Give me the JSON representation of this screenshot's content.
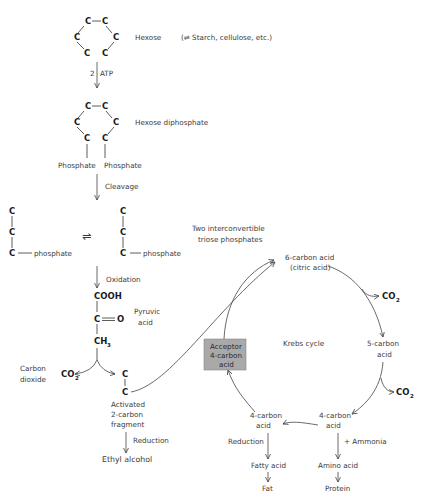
{
  "diagram": {
    "hexose": {
      "atom": "C",
      "label": "Hexose",
      "note": "(⇌ Starch, cellulose, etc.)"
    },
    "step_atp": {
      "coef": "2",
      "label": "ATP"
    },
    "hexose_diphosphate": {
      "label": "Hexose diphosphate",
      "phosphate_left": "Phosphate",
      "phosphate_right": "Phosphate"
    },
    "cleavage": {
      "label": "Cleavage"
    },
    "triose": {
      "left_phosphate": "phosphate",
      "right_phosphate": "phosphate",
      "equilibrium": "⇌",
      "label_line1": "Two interconvertible",
      "label_line2": "triose phosphates"
    },
    "oxidation": {
      "label": "Oxidation"
    },
    "pyruvic": {
      "cooh": "COOH",
      "c": "C",
      "o": "O",
      "ch": "CH",
      "ch_sub": "3",
      "label_line1": "Pyruvic",
      "label_line2": "acid"
    },
    "decarboxylation": {
      "co2": "CO",
      "co2_sub": "2",
      "label_line1": "Carbon",
      "label_line2": "dioxide"
    },
    "fragment": {
      "c": "C",
      "label_line1": "Activated",
      "label_line2": "2-carbon",
      "label_line3": "fragment"
    },
    "reduction_left": {
      "label": "Reduction",
      "product": "Ethyl alcohol"
    },
    "krebs": {
      "center_label": "Krebs cycle",
      "six_carbon_line1": "6-carbon acid",
      "six_carbon_line2": "(citric acid)",
      "five_carbon_line1": "5-carbon",
      "five_carbon_line2": "acid",
      "four_carbon_right_line1": "4-carbon",
      "four_carbon_right_line2": "acid",
      "four_carbon_left_line1": "4-carbon",
      "four_carbon_left_line2": "acid",
      "acceptor_line1": "Acceptor",
      "acceptor_line2": "4-carbon",
      "acceptor_line3": "acid",
      "acceptor_fill": "#a9a9a9",
      "co2": "CO",
      "co2_sub": "2"
    },
    "branches": {
      "reduction_label": "Reduction",
      "fatty_acid": "Fatty acid",
      "fat": "Fat",
      "ammonia_label": "+ Ammonia",
      "amino_acid": "Amino acid",
      "protein": "Protein"
    }
  }
}
